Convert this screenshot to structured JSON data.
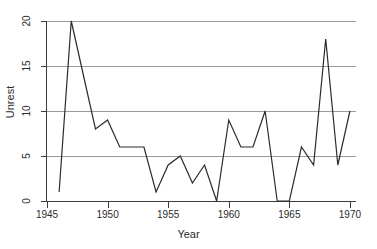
{
  "chart_data": {
    "type": "line",
    "title": "",
    "subtitle": "",
    "xlabel": "Year",
    "ylabel": "Unrest",
    "xlim": [
      1945,
      1970.5
    ],
    "ylim": [
      0,
      20
    ],
    "grid": "horizontal",
    "legend": "none",
    "line_color": "#2b2b2b",
    "grid_color": "#9a9a9a",
    "axis_color": "#3d3d3d",
    "background": "#ffffff",
    "xticks": [
      1945,
      1950,
      1955,
      1960,
      1965,
      1970
    ],
    "xtick_labels": [
      "1945",
      "1950",
      "1955",
      "1960",
      "1965",
      "1970"
    ],
    "yticks": [
      0,
      5,
      10,
      15,
      20
    ],
    "ytick_labels": [
      "0",
      "5",
      "10",
      "15",
      "20"
    ],
    "x": [
      1946,
      1947,
      1948,
      1949,
      1950,
      1951,
      1952,
      1953,
      1954,
      1955,
      1956,
      1957,
      1958,
      1959,
      1960,
      1961,
      1962,
      1963,
      1964,
      1965,
      1966,
      1967,
      1968,
      1969,
      1970
    ],
    "values": [
      1,
      20,
      14,
      8,
      9,
      6,
      6,
      6,
      1,
      4,
      5,
      2,
      4,
      0,
      9,
      6,
      6,
      10,
      0,
      0,
      6,
      4,
      18,
      4,
      10
    ],
    "series": [
      {
        "name": "Unrest",
        "values": [
          1,
          20,
          14,
          8,
          9,
          6,
          6,
          6,
          1,
          4,
          5,
          2,
          4,
          0,
          9,
          6,
          6,
          10,
          0,
          0,
          6,
          4,
          18,
          4,
          10
        ]
      }
    ]
  }
}
